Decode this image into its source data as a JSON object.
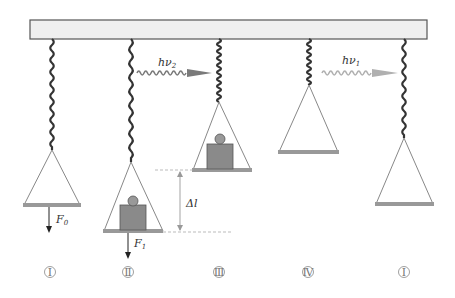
{
  "diagram": {
    "title": "",
    "photon_labels": {
      "nu2": "hν",
      "nu2_sub": "2",
      "nu1": "hν",
      "nu1_sub": "1"
    },
    "force_labels": {
      "f0": "F",
      "f0_sub": "0",
      "f1": "F",
      "f1_sub": "1"
    },
    "delta_label": "Δl",
    "stage_labels": [
      "Ⅰ",
      "Ⅱ",
      "Ⅲ",
      "Ⅳ",
      "Ⅰ"
    ],
    "stages": [
      {
        "id": "I",
        "has_mass": false,
        "spring": "long"
      },
      {
        "id": "II",
        "has_mass": true,
        "spring": "long"
      },
      {
        "id": "III",
        "has_mass": true,
        "spring": "compressed"
      },
      {
        "id": "IV",
        "has_mass": false,
        "spring": "compressed"
      },
      {
        "id": "I-return",
        "has_mass": false,
        "spring": "long"
      }
    ],
    "colors": {
      "ceiling_fill": "#efefef",
      "ceiling_stroke": "#555555",
      "spring": "#333333",
      "pan_base": "#999999",
      "mass": "#8a8a8a",
      "photon_nu2": "#7a7a7a",
      "photon_nu1": "#b0b0b0"
    }
  }
}
